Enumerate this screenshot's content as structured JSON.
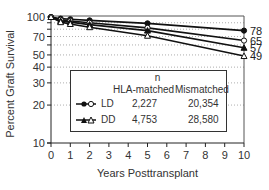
{
  "chart_data": {
    "type": "line",
    "title": "",
    "xlabel": "Years Posttransplant",
    "ylabel": "Percent Graft Survival",
    "xlim": [
      0,
      10
    ],
    "ylim": [
      10,
      100
    ],
    "yscale": "log",
    "x_ticks": [
      "0",
      "1",
      "2",
      "3",
      "4",
      "5",
      "6",
      "7",
      "8",
      "9",
      "10"
    ],
    "y_ticks": [
      "100",
      "70",
      "50",
      "40",
      "30",
      "20",
      "10"
    ],
    "grid": "horizontal dotted",
    "x": [
      0,
      0.5,
      1,
      2,
      5,
      10
    ],
    "series": [
      {
        "name": "LD HLA-matched",
        "marker": "filled-circle",
        "values": [
          100,
          97,
          96,
          94,
          89,
          78
        ],
        "end_label": "78"
      },
      {
        "name": "LD Mismatched",
        "marker": "open-circle",
        "values": [
          100,
          95,
          93,
          90,
          82,
          65
        ],
        "end_label": "65"
      },
      {
        "name": "DD HLA-matched",
        "marker": "filled-triangle",
        "values": [
          100,
          93,
          91,
          87,
          78,
          57
        ],
        "end_label": "57"
      },
      {
        "name": "DD Mismatched",
        "marker": "open-triangle",
        "values": [
          100,
          91,
          88,
          83,
          71,
          49
        ],
        "end_label": "49"
      }
    ],
    "legend": {
      "position": "inside-lower-center",
      "header_n": "n",
      "col_matched": "HLA-matched",
      "col_mismatched": "Mismatched",
      "rows": [
        {
          "label": "LD",
          "matched_n": "2,227",
          "mismatched_n": "20,354"
        },
        {
          "label": "DD",
          "matched_n": "4,753",
          "mismatched_n": "28,580"
        }
      ]
    }
  }
}
